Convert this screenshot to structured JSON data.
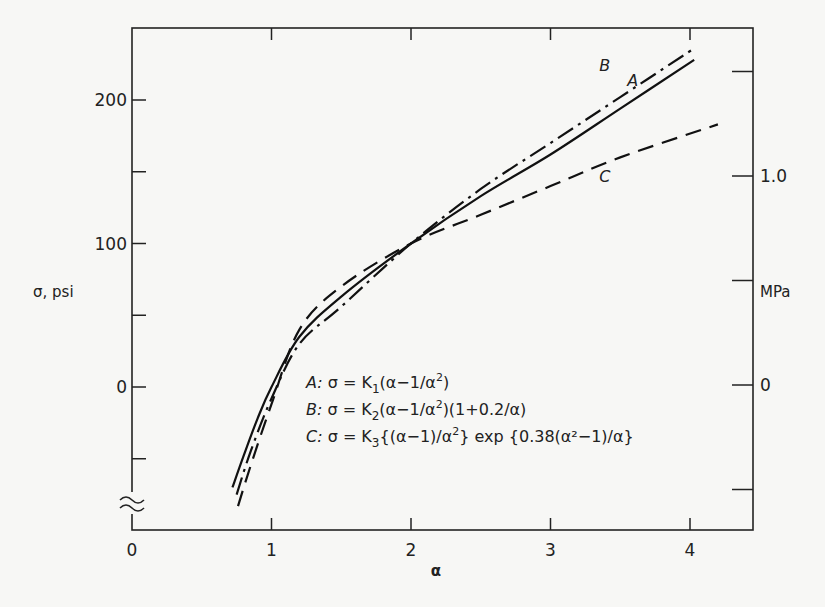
{
  "chart_data": {
    "type": "line",
    "title": "",
    "xlabel": "α",
    "ylabel": "σ, psi",
    "ylabel_right": "MPa",
    "xlim": [
      0,
      4.45
    ],
    "ylim": [
      -100,
      245
    ],
    "y_axis_break": true,
    "grid": false,
    "x_ticks": [
      0,
      1,
      2,
      3,
      4
    ],
    "x_tick_labels": [
      "0",
      "1",
      "2",
      "3",
      "4"
    ],
    "y_ticks_major": [
      0,
      100,
      200
    ],
    "y_tick_labels": [
      "0",
      "100",
      "200"
    ],
    "y_ticks_minor": [
      -50,
      50,
      150
    ],
    "top_ticks": [
      1,
      2,
      3,
      4
    ],
    "right_ticks_mpa": [
      -0.5,
      0,
      0.5,
      1.0,
      1.5
    ],
    "right_tick_labels": {
      "0": "0",
      "1.0": "1.0"
    },
    "series": [
      {
        "name": "A",
        "equation": "A: σ = K₁(α−1/α²)",
        "style": "solid",
        "x": [
          0.72,
          0.8,
          0.9,
          1.0,
          1.2,
          1.5,
          2.0,
          2.5,
          3.0,
          3.5,
          4.03
        ],
        "y": [
          -70,
          -48,
          -22,
          0,
          35,
          63,
          100,
          133,
          162,
          194,
          228
        ]
      },
      {
        "name": "B",
        "equation": "B: σ = K₂(α−1/α²)(1+0.2/α)",
        "style": "dash-dot",
        "x": [
          0.75,
          0.85,
          1.0,
          1.2,
          1.5,
          2.0,
          2.5,
          3.0,
          3.5,
          4.03
        ],
        "y": [
          -75,
          -45,
          -8,
          30,
          56,
          100,
          138,
          170,
          202,
          236
        ]
      },
      {
        "name": "C",
        "equation": "C: σ = K₃{(α−1)/α²} exp{0.38(α²−1)/α}",
        "style": "dashed",
        "x": [
          0.76,
          0.85,
          1.0,
          1.2,
          1.5,
          2.0,
          2.5,
          3.0,
          3.5,
          4.2
        ],
        "y": [
          -83,
          -55,
          -12,
          40,
          70,
          100,
          120,
          140,
          160,
          183
        ]
      }
    ],
    "annotations": [
      {
        "text": "A",
        "x": 3.55,
        "y": 210
      },
      {
        "text": "B",
        "x": 3.35,
        "y": 220
      },
      {
        "text": "C",
        "x": 3.35,
        "y": 143
      }
    ]
  },
  "legend": {
    "lines": [
      {
        "prefix": "A:",
        "text": "σ = K",
        "sub": "1",
        "rest": "(α−1/α",
        "sup": "2",
        "tail": ")"
      },
      {
        "prefix": "B:",
        "text": "σ = K",
        "sub": "2",
        "rest": "(α−1/α",
        "sup": "2",
        "tail": ")(1+0.2/α)"
      },
      {
        "prefix": "C:",
        "text": "σ = K",
        "sub": "3",
        "rest": "{(α−1)/α",
        "sup": "2",
        "tail": "} exp {0.38(α²−1)/α}"
      }
    ]
  }
}
